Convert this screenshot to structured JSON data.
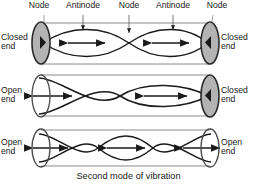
{
  "figure": {
    "title_caption": "Second mode of vibration",
    "colors": {
      "stroke": "#1a1a1a",
      "tube_outline": "#8a8a8a",
      "closed_cap_fill": "#b3b3b3",
      "open_cap_fill": "#ffffff",
      "background": "#ffffff",
      "text": "#1a1a1a"
    },
    "top_labels": [
      {
        "text": "Node",
        "x": 22,
        "y": 1,
        "w": 34,
        "pointer_x": 44,
        "arrowhead": false
      },
      {
        "text": "Antinode",
        "x": 58,
        "y": 1,
        "w": 50,
        "pointer_x": 83,
        "arrowhead": true
      },
      {
        "text": "Node",
        "x": 112,
        "y": 1,
        "w": 34,
        "pointer_x": 129,
        "arrowhead": false
      },
      {
        "text": "Antinode",
        "x": 148,
        "y": 1,
        "w": 50,
        "pointer_x": 173,
        "arrowhead": true
      },
      {
        "text": "Node",
        "x": 200,
        "y": 1,
        "w": 34,
        "pointer_x": 213,
        "arrowhead": false
      }
    ],
    "tubes": [
      {
        "name": "closed-closed-tube",
        "left_end": {
          "label": "Closed\nend",
          "state": "closed"
        },
        "right_end": {
          "label": "Closed\nend",
          "state": "closed"
        },
        "loops": 2,
        "antinode_arrows": 2,
        "nodes": 3
      },
      {
        "name": "open-closed-tube",
        "left_end": {
          "label": "Open\nend",
          "state": "open"
        },
        "right_end": {
          "label": "Closed\nend",
          "state": "closed"
        },
        "loops": 2,
        "antinode_arrows": 2,
        "nodes": 2
      },
      {
        "name": "open-open-tube",
        "left_end": {
          "label": "Open\nend",
          "state": "open"
        },
        "right_end": {
          "label": "Open\nend",
          "state": "open"
        },
        "loops": 3,
        "antinode_arrows": 3,
        "nodes": 2
      }
    ]
  }
}
